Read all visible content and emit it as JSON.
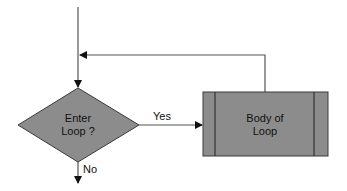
{
  "diagram": {
    "type": "flowchart",
    "colors": {
      "shape_fill": "#8c8c8c",
      "shape_stroke": "#3a3a3a",
      "line": "#555555",
      "arrow": "#111111",
      "background": "#ffffff"
    },
    "nodes": {
      "decision": {
        "line1": "Enter",
        "line2": "Loop ?"
      },
      "process": {
        "line1": "Body of",
        "line2": "Loop"
      }
    },
    "edges": {
      "yes_label": "Yes",
      "no_label": "No"
    }
  }
}
